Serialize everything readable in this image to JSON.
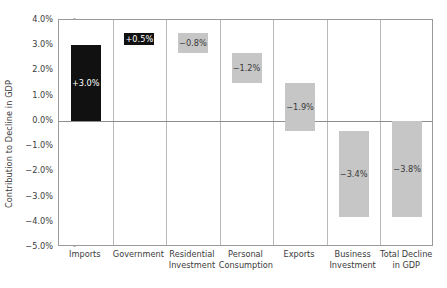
{
  "chart_data": {
    "type": "bar",
    "subtype": "waterfall",
    "title": "",
    "xlabel": "",
    "ylabel": "Contribution to Decline in GDP",
    "ylim": [
      -5.0,
      4.0
    ],
    "ytick_step": 1.0,
    "ytick_labels": [
      "4.0%",
      "3.0%",
      "2.0%",
      "1.0%",
      "0.0%",
      "-1.0%",
      "-2.0%",
      "-3.0%",
      "-4.0%",
      "-5.0%"
    ],
    "ytick_values": [
      4.0,
      3.0,
      2.0,
      1.0,
      0.0,
      -1.0,
      -2.0,
      -3.0,
      -4.0,
      -5.0
    ],
    "grid": "vertical-category-separators",
    "legend": "none",
    "categories": [
      "Imports",
      "Government",
      "Residential Investment",
      "Personal Consumption",
      "Exports",
      "Business Investment",
      "Total Decline in GDP"
    ],
    "values": [
      3.0,
      0.5,
      -0.8,
      -1.2,
      -1.9,
      -3.4,
      -3.8
    ],
    "data_labels": [
      "+3.0%",
      "+0.5%",
      "-0.8%",
      "-1.2%",
      "-1.9%",
      "-3.4%",
      "-3.8%"
    ],
    "bars": [
      {
        "category": "Imports",
        "label_lines": [
          "Imports"
        ],
        "value": 3.0,
        "data_label": "+3.0%",
        "base": 0.0,
        "top": 3.0,
        "color": "#111111",
        "label_color": "#ffffff",
        "sign": "pos"
      },
      {
        "category": "Government",
        "label_lines": [
          "Government"
        ],
        "value": 0.5,
        "data_label": "+0.5%",
        "base": 3.0,
        "top": 3.5,
        "color": "#111111",
        "label_color": "#ffffff",
        "sign": "pos"
      },
      {
        "category": "Residential Investment",
        "label_lines": [
          "Residential",
          "Investment"
        ],
        "value": -0.8,
        "data_label": "-0.8%",
        "base": 3.5,
        "top": 2.7,
        "color": "#c6c6c6",
        "label_color": "#3a3a3a",
        "sign": "neg"
      },
      {
        "category": "Personal Consumption",
        "label_lines": [
          "Personal",
          "Consumption"
        ],
        "value": -1.2,
        "data_label": "-1.2%",
        "base": 2.7,
        "top": 1.5,
        "color": "#c6c6c6",
        "label_color": "#3a3a3a",
        "sign": "neg"
      },
      {
        "category": "Exports",
        "label_lines": [
          "Exports"
        ],
        "value": -1.9,
        "data_label": "-1.9%",
        "base": 1.5,
        "top": -0.4,
        "color": "#c6c6c6",
        "label_color": "#3a3a3a",
        "sign": "neg"
      },
      {
        "category": "Business Investment",
        "label_lines": [
          "Business",
          "Investment"
        ],
        "value": -3.4,
        "data_label": "-3.4%",
        "base": -0.4,
        "top": -3.8,
        "color": "#c6c6c6",
        "label_color": "#3a3a3a",
        "sign": "neg"
      },
      {
        "category": "Total Decline in GDP",
        "label_lines": [
          "Total Decline",
          "in GDP"
        ],
        "value": -3.8,
        "data_label": "-3.8%",
        "base": 0.0,
        "top": -3.8,
        "color": "#c6c6c6",
        "label_color": "#3a3a3a",
        "sign": "neg"
      }
    ],
    "colors": {
      "positive_bar": "#111111",
      "negative_bar": "#c6c6c6",
      "axis": "#9a9a9a",
      "gridline": "#b9b9b9",
      "zero_line": "#8d8d8d",
      "text": "#3b3b3b",
      "background": "#ffffff"
    }
  }
}
